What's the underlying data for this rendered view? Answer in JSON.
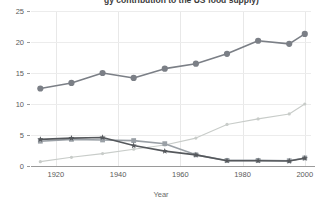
{
  "chart_data": {
    "type": "line",
    "title": "gy contribution to the US food supply)",
    "xlabel": "Year",
    "ylabel": "",
    "x": [
      1915,
      1925,
      1935,
      1945,
      1955,
      1965,
      1975,
      1985,
      1995,
      2000
    ],
    "xlim": [
      1912,
      2002
    ],
    "ylim": [
      0,
      25
    ],
    "yticks": [
      0,
      5,
      10,
      15,
      20,
      25
    ],
    "xticks": [
      1920,
      1940,
      1960,
      1980,
      2000
    ],
    "grid": true,
    "legend": "none",
    "series": [
      {
        "name": "series-1-top",
        "color": "#7b7f86",
        "marker": "circle",
        "values": [
          12.5,
          13.4,
          15.0,
          14.2,
          15.7,
          16.5,
          18.1,
          20.2,
          19.7,
          21.3
        ]
      },
      {
        "name": "series-2-declining-square",
        "color": "#9aa0a6",
        "marker": "square",
        "values": [
          4.0,
          4.3,
          4.2,
          4.1,
          3.6,
          1.8,
          0.9,
          0.9,
          0.85,
          1.3
        ]
      },
      {
        "name": "series-3-declining-star",
        "color": "#55585c",
        "marker": "star",
        "values": [
          4.3,
          4.5,
          4.6,
          3.3,
          2.4,
          1.8,
          0.85,
          0.85,
          0.8,
          1.25
        ]
      },
      {
        "name": "series-4-rising-light",
        "color": "#c8ccc9",
        "marker": "small-circle",
        "values": [
          0.7,
          1.4,
          2.0,
          2.7,
          3.4,
          4.5,
          6.7,
          7.6,
          8.4,
          10.0
        ]
      }
    ]
  },
  "axis": {
    "y_tick_labels": [
      "0",
      "5",
      "10",
      "15",
      "20",
      "25"
    ],
    "x_tick_labels": [
      "1920",
      "1940",
      "1960",
      "1980",
      "2000"
    ],
    "x_title": "Year"
  }
}
